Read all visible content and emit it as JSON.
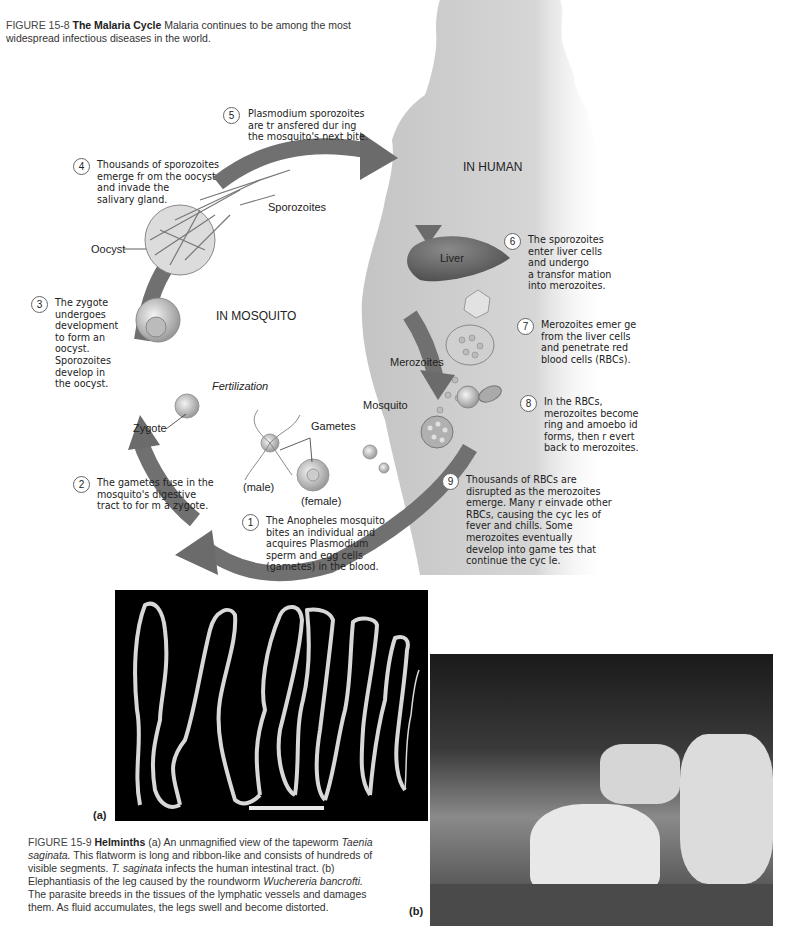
{
  "figure_15_8": {
    "label": "FIGURE 15-8",
    "title": "The Malaria Cycle",
    "text": "Malaria continues to be among the most widespread infectious diseases in the world.",
    "regions": {
      "human": "IN HUMAN",
      "mosquito": "IN MOSQUITO"
    },
    "labels": {
      "sporozoites": "Sporozoites",
      "oocyst": "Oocyst",
      "liver": "Liver",
      "merozoites": "Merozoites",
      "mosquito": "Mosquito",
      "gametes": "Gametes",
      "male": "(male)",
      "female": "(female)",
      "zygote": "Zygote",
      "fertilization": "Fertilization"
    },
    "steps": [
      {
        "n": "1",
        "lines": [
          "The Anopheles  mosquito",
          "bites an individual and",
          "acquires  Plasmodium",
          "sperm and egg cells",
          "(gametes) in the blood."
        ]
      },
      {
        "n": "2",
        "lines": [
          "The gametes fuse in the",
          "mosquito's digestive",
          "tract to for m a zygote."
        ]
      },
      {
        "n": "3",
        "lines": [
          "The zygote",
          "undergoes",
          "development",
          "to form an",
          "oocyst.",
          "Sporozoites",
          "develop in",
          "the oocyst."
        ]
      },
      {
        "n": "4",
        "lines": [
          "Thousands of sporozoites",
          "emerge fr om the oocyst",
          "and invade the",
          "salivary gland."
        ]
      },
      {
        "n": "5",
        "lines": [
          "Plasmodium  sporozoites",
          "are tr ansfered dur  ing",
          "the mosquito's next bite."
        ]
      },
      {
        "n": "6",
        "lines": [
          "The sporozoites",
          "enter liver cells",
          "and undergo",
          "a transfor mation",
          "into merozoites."
        ]
      },
      {
        "n": "7",
        "lines": [
          "Merozoites emer  ge",
          "from the liver  cells",
          "and penetrate   red",
          "blood cells (RBCs)."
        ]
      },
      {
        "n": "8",
        "lines": [
          "In the RBCs,",
          "merozoites become",
          "ring and amoebo  id",
          "forms, then r evert",
          "back to merozoites."
        ]
      },
      {
        "n": "9",
        "lines": [
          "Thousands of RBCs are",
          "disrupted as the    merozoites",
          "emerge. Many r   einvade other",
          "RBCs, causing the cyc      les of",
          "fever and chills. Some",
          "merozoites eventually",
          "develop into game  tes that",
          "continue the cyc  le."
        ]
      }
    ]
  },
  "figure_15_9": {
    "label": "FIGURE 15-9",
    "title": "Helminths",
    "text_parts": [
      {
        "t": "(a) An unmagnified view of the tapeworm ",
        "i": false
      },
      {
        "t": "Taenia saginata.",
        "i": true
      },
      {
        "t": " This flatworm is long and ribbon-like and consists of hundreds of visible segments. ",
        "i": false
      },
      {
        "t": "T. saginata",
        "i": true
      },
      {
        "t": " infects the human intestinal tract. (b) Elephantiasis of the leg caused by the roundworm ",
        "i": false
      },
      {
        "t": "Wuchereria bancrofti.",
        "i": true
      },
      {
        "t": " The parasite breeds in the tissues of the lymphatic vessels and damages them. As fluid accumulates, the legs swell and become distorted.",
        "i": false
      }
    ],
    "panel_a": "(a)",
    "panel_b": "(b)"
  },
  "colors": {
    "arrow": "#6b6b6b",
    "silhouette": "#c8c8c8",
    "photo_a_bg": "#000000"
  }
}
